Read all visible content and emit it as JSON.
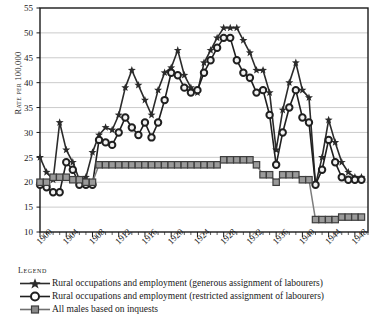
{
  "chart_data": {
    "type": "line",
    "title": "",
    "xlabel": "",
    "ylabel": "Rate per 100,000",
    "ylim": [
      10,
      55
    ],
    "ytick_step": 5,
    "yticks": [
      10,
      15,
      20,
      25,
      30,
      35,
      40,
      45,
      50,
      55
    ],
    "xlim": [
      1900,
      1950
    ],
    "xtick_step": 1,
    "xticklabels": [
      "1900",
      "1904",
      "1908",
      "1912",
      "1916",
      "1920",
      "1924",
      "1928",
      "1932",
      "1936",
      "1940",
      "1944",
      "1948"
    ],
    "xticklabel_years": [
      1900,
      1904,
      1908,
      1912,
      1916,
      1920,
      1924,
      1928,
      1932,
      1936,
      1940,
      1944,
      1948
    ],
    "grid": "horizontal",
    "legend_position": "below-axes",
    "legend_title": "Legend",
    "x": [
      1900,
      1901,
      1902,
      1903,
      1904,
      1905,
      1906,
      1907,
      1908,
      1909,
      1910,
      1911,
      1912,
      1913,
      1914,
      1915,
      1916,
      1917,
      1918,
      1919,
      1920,
      1921,
      1922,
      1923,
      1924,
      1925,
      1926,
      1927,
      1928,
      1929,
      1930,
      1931,
      1932,
      1933,
      1934,
      1935,
      1936,
      1937,
      1938,
      1939,
      1940,
      1941,
      1942,
      1943,
      1944,
      1945,
      1946,
      1947,
      1948,
      1949
    ],
    "series": [
      {
        "name": "Rural occupations and employment (generous assignment of labourers)",
        "marker": "star",
        "color": "#2b2b2b",
        "values": [
          25.0,
          22.0,
          20.5,
          32.0,
          26.5,
          24.0,
          20.5,
          21.0,
          26.0,
          29.5,
          31.0,
          30.5,
          33.5,
          39.0,
          42.5,
          39.5,
          36.5,
          33.5,
          38.5,
          42.0,
          43.0,
          46.5,
          41.5,
          39.0,
          38.0,
          44.0,
          46.5,
          49.0,
          51.0,
          51.0,
          51.0,
          48.5,
          46.0,
          42.5,
          42.5,
          38.0,
          26.5,
          34.5,
          40.0,
          44.0,
          38.5,
          37.0,
          19.5,
          25.0,
          32.5,
          28.0,
          24.0,
          22.0,
          21.0,
          21.0
        ]
      },
      {
        "name": "Rural occupations and employment (restricted assignment of labourers)",
        "marker": "circle",
        "color": "#1f1f1f",
        "values": [
          19.5,
          19.0,
          18.0,
          18.0,
          24.0,
          22.5,
          19.5,
          19.5,
          19.5,
          28.5,
          28.0,
          27.5,
          30.0,
          33.0,
          31.0,
          29.5,
          32.0,
          29.0,
          32.0,
          36.5,
          42.0,
          41.5,
          39.0,
          38.0,
          38.5,
          42.0,
          44.5,
          47.0,
          49.0,
          49.0,
          44.5,
          42.0,
          41.0,
          38.0,
          38.5,
          33.5,
          23.5,
          30.0,
          35.0,
          38.5,
          33.0,
          32.0,
          19.5,
          22.5,
          28.5,
          24.0,
          21.0,
          20.5,
          20.5,
          20.5
        ]
      },
      {
        "name": "All males based on inquests",
        "marker": "square",
        "color": "#7d7d7d",
        "values": [
          20.0,
          20.0,
          21.0,
          21.0,
          21.0,
          20.5,
          20.5,
          20.0,
          20.0,
          23.5,
          23.5,
          23.5,
          23.5,
          23.5,
          23.5,
          23.5,
          23.5,
          23.5,
          23.5,
          23.5,
          23.5,
          23.5,
          23.5,
          23.5,
          23.5,
          23.5,
          23.5,
          23.5,
          24.5,
          24.5,
          24.5,
          24.5,
          24.5,
          23.5,
          21.5,
          21.5,
          20.0,
          21.5,
          21.5,
          21.5,
          20.5,
          20.5,
          12.5,
          12.5,
          12.5,
          12.5,
          13.0,
          13.0,
          13.0,
          13.0
        ]
      }
    ]
  },
  "axes": {
    "y_axis_label": "Rate per 100,000"
  },
  "legend": {
    "title": "Legend",
    "entries": [
      {
        "key": "star-line-key",
        "label": "Rural occupations and employment (generous assignment of labourers)"
      },
      {
        "key": "circle-line-key",
        "label": "Rural occupations and employment (restricted assignment of labourers)"
      },
      {
        "key": "square-line-key",
        "label": "All males based on inquests"
      }
    ]
  }
}
